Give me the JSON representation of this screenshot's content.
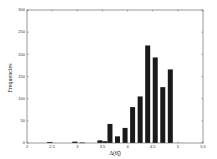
{
  "chart_data": {
    "type": "bar",
    "title": "",
    "xlabel": "Δ(θ̃ⱼ)",
    "ylabel": "Frequencies",
    "xlim": [
      2,
      5.5
    ],
    "ylim": [
      0,
      300
    ],
    "xticks": [
      "2",
      "2.5",
      "3",
      "3.5",
      "4",
      "4.5",
      "5",
      "5.5"
    ],
    "yticks": [
      "0",
      "50",
      "100",
      "150",
      "200",
      "250",
      "300"
    ],
    "grid": false,
    "legend": null,
    "bar_color": "#1a1a1a",
    "x": [
      2.45,
      2.95,
      3.1,
      3.45,
      3.55,
      3.65,
      3.8,
      3.95,
      4.1,
      4.25,
      4.4,
      4.55,
      4.7,
      4.85
    ],
    "values": [
      2,
      3,
      1,
      6,
      4,
      43,
      15,
      34,
      81,
      105,
      220,
      193,
      126,
      166
    ]
  }
}
